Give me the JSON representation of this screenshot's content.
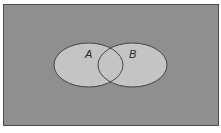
{
  "diagram": {
    "type": "venn",
    "universe": {
      "fill": "#8f8f8f",
      "border": "#4a4a4a"
    },
    "sets": [
      {
        "label": "A",
        "fill": "#c4c4c4",
        "stroke": "#3a3a3a"
      },
      {
        "label": "B",
        "fill": "#c4c4c4",
        "stroke": "#3a3a3a"
      }
    ]
  }
}
